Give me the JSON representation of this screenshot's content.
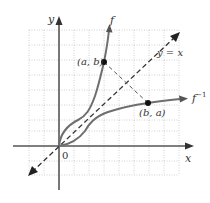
{
  "diagram": {
    "axes": {
      "x_label": "x",
      "y_label": "y",
      "origin_label": "0"
    },
    "curves": {
      "f_label": "f",
      "finv_label": "f",
      "finv_superscript": "−1",
      "identity_label": "y = x"
    },
    "points": {
      "p1_label": "(a, b)",
      "p2_label": "(b, a)"
    },
    "colors": {
      "axis": "#555555",
      "curve": "#6e6e6e",
      "grid": "#bdbdbd",
      "dashed": "#333333",
      "point": "#111111"
    }
  }
}
